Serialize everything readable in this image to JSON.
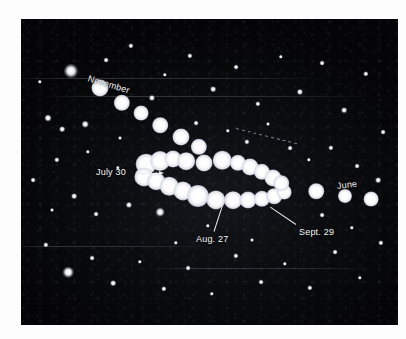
{
  "figure": {
    "kind": "astrophotograph",
    "background_color": "#ffffff",
    "plate_color": "#060608",
    "label_color": "#f4f5f7"
  },
  "annotations": [
    {
      "name": "november",
      "text": "November",
      "x": 88,
      "y": 74,
      "rotate": 17
    },
    {
      "name": "july-30",
      "text": "July 30",
      "x": 96,
      "y": 168,
      "rotate": 0
    },
    {
      "name": "aug-27",
      "text": "Aug. 27",
      "x": 196,
      "y": 235,
      "rotate": 0
    },
    {
      "name": "sept-29",
      "text": "Sept. 29",
      "x": 299,
      "y": 228,
      "rotate": 0
    },
    {
      "name": "june",
      "text": "June",
      "x": 337,
      "y": 182,
      "rotate": -7
    }
  ],
  "leaders": [
    {
      "name": "july-30-leader",
      "x": 137,
      "y": 173,
      "length": 22,
      "angle": 0,
      "arrow": true
    },
    {
      "name": "aug-27-leader",
      "x": 214,
      "y": 231,
      "length": 28,
      "angle": -72,
      "arrow": false
    },
    {
      "name": "sept-29-leader",
      "x": 296,
      "y": 224,
      "length": 31,
      "angle": -146,
      "arrow": false
    }
  ],
  "ecliptic_marker": {
    "name": "ecliptic-dashes",
    "x": 236,
    "y": 128,
    "length": 66,
    "angle": 14
  },
  "planet_track": {
    "description": "Composite positions of the planet photographed on successive dates, forming a retrograde loop.",
    "positions": [
      {
        "x": 100,
        "y": 88,
        "r": 4.6
      },
      {
        "x": 122,
        "y": 103,
        "r": 4.4
      },
      {
        "x": 141,
        "y": 113,
        "r": 4.0
      },
      {
        "x": 160,
        "y": 125,
        "r": 4.2
      },
      {
        "x": 181,
        "y": 137,
        "r": 4.6
      },
      {
        "x": 199,
        "y": 147,
        "r": 4.4
      },
      {
        "x": 146,
        "y": 164,
        "r": 5.6
      },
      {
        "x": 160,
        "y": 161,
        "r": 5.4
      },
      {
        "x": 173,
        "y": 159,
        "r": 4.6
      },
      {
        "x": 186,
        "y": 161,
        "r": 4.8
      },
      {
        "x": 204,
        "y": 163,
        "r": 4.6
      },
      {
        "x": 222,
        "y": 160,
        "r": 5.0
      },
      {
        "x": 238,
        "y": 163,
        "r": 4.4
      },
      {
        "x": 250,
        "y": 167,
        "r": 4.6
      },
      {
        "x": 262,
        "y": 172,
        "r": 4.4
      },
      {
        "x": 273,
        "y": 178,
        "r": 4.6
      },
      {
        "x": 144,
        "y": 177,
        "r": 5.2
      },
      {
        "x": 156,
        "y": 181,
        "r": 4.8
      },
      {
        "x": 169,
        "y": 186,
        "r": 5.0
      },
      {
        "x": 183,
        "y": 191,
        "r": 5.2
      },
      {
        "x": 198,
        "y": 196,
        "r": 6.0
      },
      {
        "x": 216,
        "y": 200,
        "r": 5.2
      },
      {
        "x": 233,
        "y": 200,
        "r": 4.8
      },
      {
        "x": 248,
        "y": 200,
        "r": 4.6
      },
      {
        "x": 262,
        "y": 199,
        "r": 4.4
      },
      {
        "x": 274,
        "y": 196,
        "r": 4.2
      },
      {
        "x": 284,
        "y": 192,
        "r": 4.0
      },
      {
        "x": 281,
        "y": 183,
        "r": 4.2
      },
      {
        "x": 316,
        "y": 191,
        "r": 4.2
      },
      {
        "x": 345,
        "y": 196,
        "r": 3.8
      },
      {
        "x": 371,
        "y": 199,
        "r": 4.0
      }
    ]
  },
  "starfield": {
    "description": "Background fixed stars on the photographic plate.",
    "stars": [
      {
        "x": 71,
        "y": 71,
        "r": 3.2
      },
      {
        "x": 48,
        "y": 118,
        "r": 1.6
      },
      {
        "x": 62,
        "y": 129,
        "r": 1.3
      },
      {
        "x": 85,
        "y": 124,
        "r": 1.5
      },
      {
        "x": 106,
        "y": 60,
        "r": 1.1
      },
      {
        "x": 131,
        "y": 46,
        "r": 1.2
      },
      {
        "x": 152,
        "y": 98,
        "r": 1.4
      },
      {
        "x": 165,
        "y": 75,
        "r": 1.0
      },
      {
        "x": 190,
        "y": 56,
        "r": 1.2
      },
      {
        "x": 213,
        "y": 89,
        "r": 1.3
      },
      {
        "x": 236,
        "y": 67,
        "r": 1.1
      },
      {
        "x": 258,
        "y": 104,
        "r": 1.2
      },
      {
        "x": 281,
        "y": 57,
        "r": 1.0
      },
      {
        "x": 300,
        "y": 92,
        "r": 1.4
      },
      {
        "x": 322,
        "y": 63,
        "r": 1.1
      },
      {
        "x": 344,
        "y": 110,
        "r": 1.3
      },
      {
        "x": 366,
        "y": 74,
        "r": 1.2
      },
      {
        "x": 383,
        "y": 132,
        "r": 1.1
      },
      {
        "x": 57,
        "y": 160,
        "r": 1.2
      },
      {
        "x": 74,
        "y": 196,
        "r": 1.3
      },
      {
        "x": 96,
        "y": 214,
        "r": 1.1
      },
      {
        "x": 118,
        "y": 168,
        "r": 1.0
      },
      {
        "x": 129,
        "y": 205,
        "r": 1.4
      },
      {
        "x": 160,
        "y": 212,
        "r": 2.0
      },
      {
        "x": 196,
        "y": 123,
        "r": 1.1
      },
      {
        "x": 228,
        "y": 131,
        "r": 1.0
      },
      {
        "x": 247,
        "y": 142,
        "r": 1.2
      },
      {
        "x": 290,
        "y": 148,
        "r": 1.1
      },
      {
        "x": 309,
        "y": 160,
        "r": 1.0
      },
      {
        "x": 331,
        "y": 148,
        "r": 1.2
      },
      {
        "x": 357,
        "y": 166,
        "r": 1.1
      },
      {
        "x": 378,
        "y": 180,
        "r": 1.3
      },
      {
        "x": 46,
        "y": 245,
        "r": 1.2
      },
      {
        "x": 68,
        "y": 272,
        "r": 2.4
      },
      {
        "x": 92,
        "y": 258,
        "r": 1.1
      },
      {
        "x": 113,
        "y": 283,
        "r": 1.3
      },
      {
        "x": 140,
        "y": 262,
        "r": 1.0
      },
      {
        "x": 164,
        "y": 289,
        "r": 1.2
      },
      {
        "x": 188,
        "y": 268,
        "r": 1.1
      },
      {
        "x": 212,
        "y": 294,
        "r": 1.0
      },
      {
        "x": 236,
        "y": 256,
        "r": 1.2
      },
      {
        "x": 261,
        "y": 282,
        "r": 1.1
      },
      {
        "x": 285,
        "y": 264,
        "r": 1.0
      },
      {
        "x": 310,
        "y": 288,
        "r": 1.2
      },
      {
        "x": 335,
        "y": 252,
        "r": 1.1
      },
      {
        "x": 360,
        "y": 278,
        "r": 1.0
      },
      {
        "x": 381,
        "y": 243,
        "r": 1.2
      },
      {
        "x": 40,
        "y": 82,
        "r": 1.0
      },
      {
        "x": 33,
        "y": 180,
        "r": 1.1
      },
      {
        "x": 52,
        "y": 210,
        "r": 0.9
      },
      {
        "x": 176,
        "y": 243,
        "r": 1.0
      },
      {
        "x": 252,
        "y": 240,
        "r": 0.9
      },
      {
        "x": 208,
        "y": 226,
        "r": 1.0
      },
      {
        "x": 322,
        "y": 215,
        "r": 1.1
      },
      {
        "x": 352,
        "y": 228,
        "r": 1.0
      },
      {
        "x": 120,
        "y": 138,
        "r": 0.9
      },
      {
        "x": 88,
        "y": 152,
        "r": 1.0
      },
      {
        "x": 268,
        "y": 124,
        "r": 0.9
      }
    ]
  },
  "streaks": [
    {
      "x": 0,
      "y": 78,
      "width": 330
    },
    {
      "x": 40,
      "y": 96,
      "width": 337
    },
    {
      "x": 0,
      "y": 246,
      "width": 210
    },
    {
      "x": 150,
      "y": 268,
      "width": 227
    }
  ]
}
